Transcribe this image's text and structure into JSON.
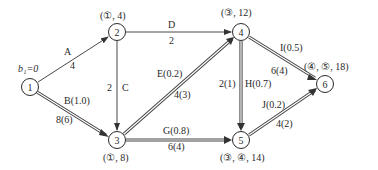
{
  "diagram": {
    "type": "network-graph",
    "start_label": "b₁=0",
    "nodes": [
      {
        "id": "1",
        "x": 30,
        "y": 87,
        "label": "1",
        "annotation": ""
      },
      {
        "id": "2",
        "x": 117,
        "y": 32,
        "label": "2",
        "annotation": "(①, 4)"
      },
      {
        "id": "3",
        "x": 117,
        "y": 140,
        "label": "3",
        "annotation": "(①, 8)"
      },
      {
        "id": "4",
        "x": 241,
        "y": 32,
        "label": "4",
        "annotation": "(③, 12)"
      },
      {
        "id": "5",
        "x": 241,
        "y": 140,
        "label": "5",
        "annotation": "(③, ④, 14)"
      },
      {
        "id": "6",
        "x": 325,
        "y": 84,
        "label": "6",
        "annotation": "(④, ⑤, 18)"
      }
    ],
    "edges": [
      {
        "from": "1",
        "to": "2",
        "name": "A",
        "value": "4",
        "double": false
      },
      {
        "from": "1",
        "to": "3",
        "name": "B(1.0)",
        "value": "8(6)",
        "double": true
      },
      {
        "from": "2",
        "to": "3",
        "name": "C",
        "value": "2",
        "double": false
      },
      {
        "from": "2",
        "to": "4",
        "name": "D",
        "value": "2",
        "double": false
      },
      {
        "from": "3",
        "to": "4",
        "name": "E(0.2)",
        "value": "4(3)",
        "double": true
      },
      {
        "from": "3",
        "to": "5",
        "name": "G(0.8)",
        "value": "6(4)",
        "double": true
      },
      {
        "from": "4",
        "to": "5",
        "name": "H(0.7)",
        "value": "2(1)",
        "double": true
      },
      {
        "from": "4",
        "to": "6",
        "name": "I(0.5)",
        "value": "6(4)",
        "double": true
      },
      {
        "from": "5",
        "to": "6",
        "name": "J(0.2)",
        "value": "4(2)",
        "double": true
      }
    ]
  }
}
